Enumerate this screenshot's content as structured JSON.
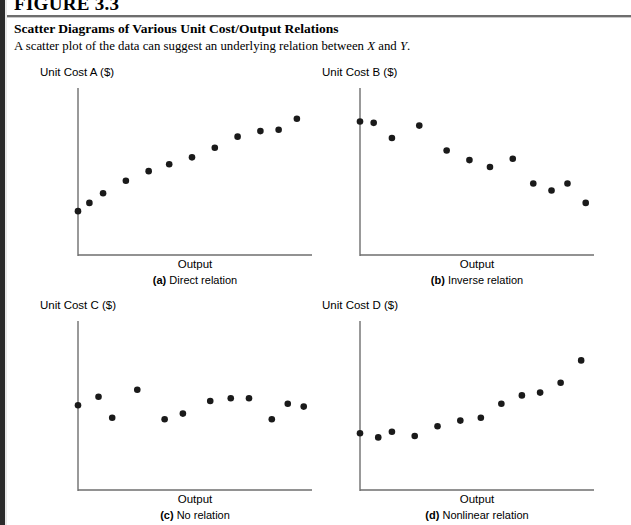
{
  "header": {
    "figure_number": "FIGURE 3.3",
    "title": "Scatter Diagrams of Various Unit Cost/Output Relations",
    "caption_pre": "A scatter plot of the data can suggest an underlying relation between ",
    "caption_var1": "X",
    "caption_mid": " and ",
    "caption_var2": "Y",
    "caption_post": "."
  },
  "style": {
    "axis_color": "#6e6e6e",
    "point_color": "#1a1a1a",
    "text_color": "#000000",
    "edge_bar_color": "#2b2b2b"
  },
  "chart_data": [
    {
      "id": "a",
      "type": "scatter",
      "title": "",
      "ylabel": "Unit Cost A ($)",
      "xlabel": "Output",
      "tag": "(a)",
      "relation": "Direct relation",
      "grid": false,
      "legend": "none",
      "xlim": [
        0,
        100
      ],
      "ylim": [
        0,
        100
      ],
      "x": [
        0,
        5,
        11,
        21,
        31,
        40,
        50,
        60,
        70,
        80,
        88,
        96
      ],
      "y": [
        18,
        24,
        31,
        40,
        47,
        52,
        57,
        64,
        72,
        76,
        77,
        85
      ]
    },
    {
      "id": "b",
      "type": "scatter",
      "title": "",
      "ylabel": "Unit Cost B ($)",
      "xlabel": "Output",
      "tag": "(b)",
      "relation": "Inverse relation",
      "grid": false,
      "legend": "none",
      "xlim": [
        0,
        100
      ],
      "ylim": [
        0,
        100
      ],
      "x": [
        0,
        6,
        14,
        26,
        38,
        48,
        57,
        67,
        76,
        84,
        91,
        99
      ],
      "y": [
        83,
        82,
        71,
        80,
        62,
        55,
        50,
        56,
        38,
        33,
        38,
        24
      ]
    },
    {
      "id": "c",
      "type": "scatter",
      "title": "",
      "ylabel": "Unit Cost C ($)",
      "xlabel": "Output",
      "tag": "(c)",
      "relation": "No relation",
      "grid": false,
      "legend": "none",
      "xlim": [
        0,
        100
      ],
      "ylim": [
        0,
        100
      ],
      "x": [
        0,
        9,
        15,
        26,
        38,
        46,
        58,
        67,
        75,
        85,
        92,
        99
      ],
      "y": [
        47,
        53,
        38,
        58,
        37,
        41,
        50,
        52,
        52,
        37,
        48,
        46
      ]
    },
    {
      "id": "d",
      "type": "scatter",
      "title": "",
      "ylabel": "Unit Cost D ($)",
      "xlabel": "Output",
      "tag": "(d)",
      "relation": "Nonlinear relation",
      "grid": false,
      "legend": "none",
      "xlim": [
        0,
        100
      ],
      "ylim": [
        0,
        100
      ],
      "x": [
        0,
        8,
        14,
        24,
        34,
        44,
        53,
        62,
        71,
        79,
        88,
        97
      ],
      "y": [
        27,
        24,
        28,
        25,
        32,
        36,
        38,
        48,
        54,
        56,
        63,
        79
      ]
    }
  ]
}
